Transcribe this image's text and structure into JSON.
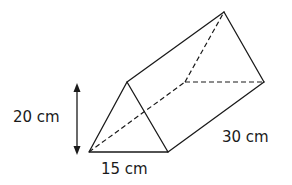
{
  "figure": {
    "type": "triangular-prism",
    "stroke_color": "#1a1a1a",
    "labels": {
      "height": "20 cm",
      "base": "15 cm",
      "length": "30 cm"
    }
  }
}
